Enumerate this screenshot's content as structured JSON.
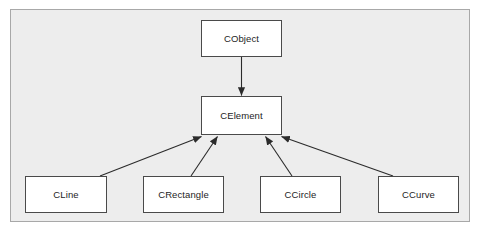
{
  "figure": {
    "type": "uml-class-inheritance-diagram",
    "background_color": "#ededed",
    "frame_border_color": "#a8a8a8",
    "box_fill_color": "#ffffff",
    "box_border_color": "#4a4a4a",
    "connector_color": "#2b2b2b",
    "text_color": "#1d1d1d",
    "caption": ""
  },
  "classes": {
    "root": {
      "label": "CObject"
    },
    "base": {
      "label": "CElement"
    },
    "derived": [
      {
        "label": "CLine"
      },
      {
        "label": "CRectangle"
      },
      {
        "label": "CCircle"
      },
      {
        "label": "CCurve"
      }
    ]
  },
  "relationships": [
    {
      "from": "CObject",
      "to": "CElement",
      "kind": "inheritance"
    },
    {
      "from": "CLine",
      "to": "CElement",
      "kind": "inheritance"
    },
    {
      "from": "CRectangle",
      "to": "CElement",
      "kind": "inheritance"
    },
    {
      "from": "CCircle",
      "to": "CElement",
      "kind": "inheritance"
    },
    {
      "from": "CCurve",
      "to": "CElement",
      "kind": "inheritance"
    }
  ]
}
